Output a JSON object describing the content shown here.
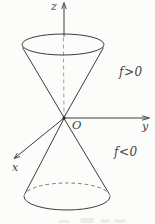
{
  "figure": {
    "background_color": "#fcfcfa",
    "line_color": "#3c3c3c",
    "dash_color": "#9b9b9b",
    "text_color": "#3f3f3f",
    "axes": {
      "z_label": "z",
      "y_label": "y",
      "x_label": "x"
    },
    "origin_label": "O",
    "regions": {
      "upper_label": "f>0",
      "lower_label": "f<0"
    }
  }
}
